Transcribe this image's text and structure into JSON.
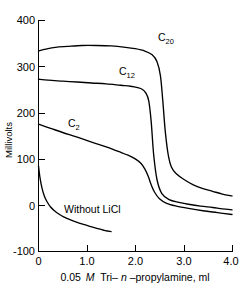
{
  "chart_data": {
    "type": "line",
    "title": "",
    "xlabel": "0.05 M Tri-n-propylamine, ml",
    "ylabel": "Millivolts",
    "xlim": [
      0,
      4.0
    ],
    "ylim": [
      -100,
      400
    ],
    "x_ticks": [
      "0",
      "1.0",
      "2.0",
      "3.0",
      "4.0"
    ],
    "x_tick_values": [
      0,
      1.0,
      2.0,
      3.0,
      4.0
    ],
    "y_ticks": [
      "400",
      "300",
      "200",
      "100",
      "0",
      "-100"
    ],
    "y_tick_values": [
      400,
      300,
      200,
      100,
      0,
      -100
    ],
    "grid": false,
    "legend": "inline-labels",
    "line_color": "#000000",
    "background_color": "#ffffff",
    "series": [
      {
        "name": "C20",
        "label_text": "C",
        "label_sub": "20",
        "x": [
          0.0,
          0.15,
          0.35,
          0.6,
          0.9,
          1.2,
          1.5,
          1.8,
          2.0,
          2.2,
          2.35,
          2.45,
          2.52,
          2.57,
          2.62,
          2.68,
          2.75,
          2.85,
          3.0,
          3.2,
          3.4,
          3.6,
          3.8,
          4.0
        ],
        "y": [
          333,
          337,
          341,
          343,
          345,
          345,
          344,
          341,
          338,
          333,
          325,
          310,
          280,
          225,
          160,
          110,
          82,
          68,
          56,
          44,
          36,
          30,
          24,
          20
        ]
      },
      {
        "name": "C12",
        "label_text": "C",
        "label_sub": "12",
        "x": [
          0.0,
          0.2,
          0.5,
          0.8,
          1.1,
          1.4,
          1.7,
          1.9,
          2.05,
          2.15,
          2.22,
          2.28,
          2.33,
          2.38,
          2.45,
          2.55,
          2.7,
          2.9,
          3.1,
          3.35,
          3.6,
          3.8,
          4.0
        ],
        "y": [
          272,
          270,
          268,
          266,
          264,
          262,
          259,
          257,
          254,
          250,
          242,
          225,
          180,
          110,
          55,
          25,
          12,
          6,
          2,
          -2,
          -5,
          -8,
          -10
        ]
      },
      {
        "name": "C2",
        "label_text": "C",
        "label_sub": "2",
        "x": [
          0.0,
          0.25,
          0.5,
          0.8,
          1.1,
          1.4,
          1.65,
          1.85,
          2.0,
          2.12,
          2.2,
          2.27,
          2.33,
          2.4,
          2.5,
          2.65,
          2.85,
          3.1,
          3.4,
          3.7,
          4.0
        ],
        "y": [
          175,
          166,
          157,
          147,
          136,
          126,
          116,
          108,
          100,
          90,
          78,
          62,
          44,
          28,
          14,
          4,
          -2,
          -7,
          -12,
          -16,
          -20
        ]
      },
      {
        "name": "Without LiCl",
        "label_text": "Without LiCl",
        "label_sub": "",
        "x": [
          0.0,
          0.03,
          0.07,
          0.12,
          0.18,
          0.25,
          0.33,
          0.42,
          0.52,
          0.65,
          0.8,
          0.95,
          1.1,
          1.25,
          1.38,
          1.5
        ],
        "y": [
          85,
          60,
          38,
          20,
          7,
          -4,
          -12,
          -19,
          -25,
          -31,
          -37,
          -42,
          -47,
          -51,
          -55,
          -57
        ]
      }
    ],
    "annotations": [
      {
        "name": "label-c20",
        "text": "C",
        "sub": "20"
      },
      {
        "name": "label-c12",
        "text": "C",
        "sub": "12"
      },
      {
        "name": "label-c2",
        "text": "C",
        "sub": "2"
      },
      {
        "name": "label-without-licl",
        "text": "Without LiCl",
        "sub": ""
      }
    ],
    "xlabel_parts": {
      "prefix": "0.05",
      "molar": "M",
      "mid": "Tri–",
      "n": "n",
      "suffix": "–propylamine, ml"
    }
  }
}
